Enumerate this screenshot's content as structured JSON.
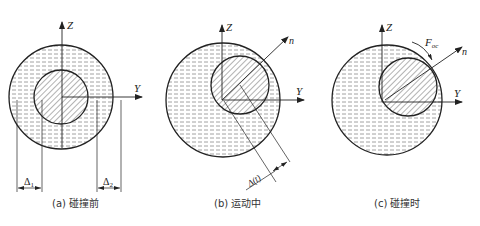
{
  "figure": {
    "panels": [
      {
        "id": "a",
        "caption": "(a) 碰撞前",
        "axis_z": "Z",
        "axis_y": "Y",
        "dim_left": "Δ",
        "dim_left_sub": "1",
        "dim_right": "Δ",
        "dim_right_sub": "2"
      },
      {
        "id": "b",
        "caption": "(b) 运动中",
        "axis_z": "Z",
        "axis_y": "Y",
        "axis_n": "n",
        "dim_label": "Δ(t)"
      },
      {
        "id": "c",
        "caption": "(c) 碰撞时",
        "axis_z": "Z",
        "axis_y": "Y",
        "axis_n": "n",
        "force_label": "F",
        "force_sub": "oc"
      }
    ],
    "colors": {
      "stroke": "#222222",
      "hatch": "#555555",
      "dash_fill": "#888888",
      "background": "#ffffff"
    }
  }
}
